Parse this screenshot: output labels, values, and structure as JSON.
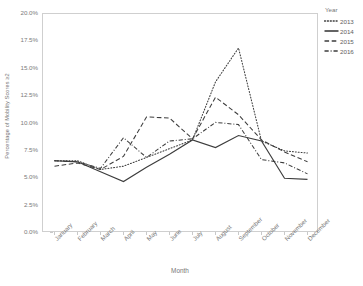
{
  "chart_data": {
    "type": "line",
    "title": "",
    "xlabel": "Month",
    "ylabel": "Percentage of Mobility Scores ≥2",
    "categories": [
      "January",
      "February",
      "March",
      "April",
      "May",
      "June",
      "July",
      "August",
      "September",
      "October",
      "November",
      "December"
    ],
    "ytick_labels": [
      "20.0%",
      "17.5%",
      "15.0%",
      "12.5%",
      "10.0%",
      "7.5%",
      "5.0%",
      "2.5%",
      "0.0%"
    ],
    "ytick_values": [
      20.0,
      17.5,
      15.0,
      12.5,
      10.0,
      7.5,
      5.0,
      2.5,
      0.0
    ],
    "ylim": [
      0.0,
      20.0
    ],
    "grid": false,
    "legend_position": "right",
    "legend_title": "Year",
    "series": [
      {
        "name": "2013",
        "style": "dotted",
        "color": "#3d3d3d",
        "values": [
          6.6,
          6.6,
          5.8,
          6.1,
          6.9,
          7.7,
          8.5,
          13.8,
          16.9,
          8.4,
          7.5,
          7.3
        ]
      },
      {
        "name": "2014",
        "style": "solid",
        "color": "#3d3d3d",
        "values": [
          6.6,
          6.5,
          5.6,
          4.7,
          6.0,
          7.2,
          8.5,
          7.8,
          8.9,
          8.4,
          5.0,
          4.9
        ]
      },
      {
        "name": "2015",
        "style": "dashed",
        "color": "#3d3d3d",
        "values": [
          6.1,
          6.4,
          5.8,
          7.0,
          10.6,
          10.5,
          8.6,
          12.4,
          10.8,
          8.5,
          7.4,
          6.5
        ]
      },
      {
        "name": "2016",
        "style": "dashdot",
        "color": "#3d3d3d",
        "values": [
          6.6,
          6.5,
          5.9,
          8.7,
          6.9,
          8.4,
          8.6,
          10.1,
          9.9,
          6.7,
          6.4,
          5.4
        ]
      }
    ]
  },
  "legend": {
    "title": "Year",
    "items": [
      {
        "label": "2013"
      },
      {
        "label": "2014"
      },
      {
        "label": "2015"
      },
      {
        "label": "2016"
      }
    ]
  },
  "axes": {
    "xlabel": "Month",
    "ylabel": "Percentage of Mobility Scores ≥2"
  }
}
